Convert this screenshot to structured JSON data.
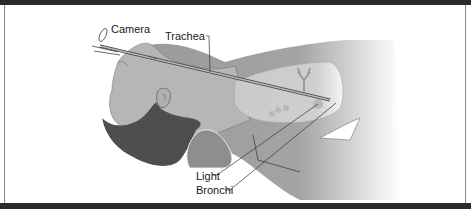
{
  "diagram": {
    "type": "anatomical-illustration",
    "labels": {
      "camera": "Camera",
      "trachea": "Trachea",
      "light": "Light",
      "bronchi": "Bronchi"
    },
    "colors": {
      "frame_dark": "#2a2a2a",
      "skin": "#a9a9a9",
      "skin_light": "#c4c4c4",
      "hair": "#4a4a4a",
      "lung": "#cfcfcf",
      "background": "#ffffff"
    }
  }
}
